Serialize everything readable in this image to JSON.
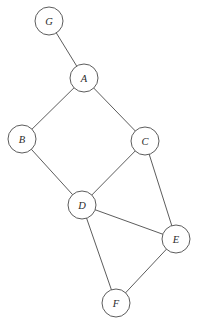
{
  "figure": {
    "background_color": "#ffffff",
    "edge_color": "#4a4a4a",
    "node_fill_color": "#ffffff",
    "node_stroke_color": "#4a4a4a",
    "label_color": "#2b2b2b",
    "node_radius": 14
  },
  "graph": {
    "nodes": [
      {
        "id": "A",
        "label": "A",
        "cx": 84,
        "cy": 78,
        "r": 14
      },
      {
        "id": "B",
        "label": "B",
        "cx": 22,
        "cy": 139,
        "r": 14
      },
      {
        "id": "C",
        "label": "C",
        "cx": 145,
        "cy": 141,
        "r": 14
      },
      {
        "id": "D",
        "label": "D",
        "cx": 82,
        "cy": 205,
        "r": 14
      },
      {
        "id": "E",
        "label": "E",
        "cx": 176,
        "cy": 239,
        "r": 14
      },
      {
        "id": "F",
        "label": "F",
        "cx": 116,
        "cy": 303,
        "r": 14
      },
      {
        "id": "G",
        "label": "G",
        "cx": 49,
        "cy": 21,
        "r": 14
      }
    ],
    "edges": [
      {
        "from": "G",
        "to": "A"
      },
      {
        "from": "A",
        "to": "B"
      },
      {
        "from": "A",
        "to": "C"
      },
      {
        "from": "B",
        "to": "D"
      },
      {
        "from": "C",
        "to": "D"
      },
      {
        "from": "C",
        "to": "E"
      },
      {
        "from": "D",
        "to": "E"
      },
      {
        "from": "D",
        "to": "F"
      },
      {
        "from": "E",
        "to": "F"
      }
    ]
  }
}
